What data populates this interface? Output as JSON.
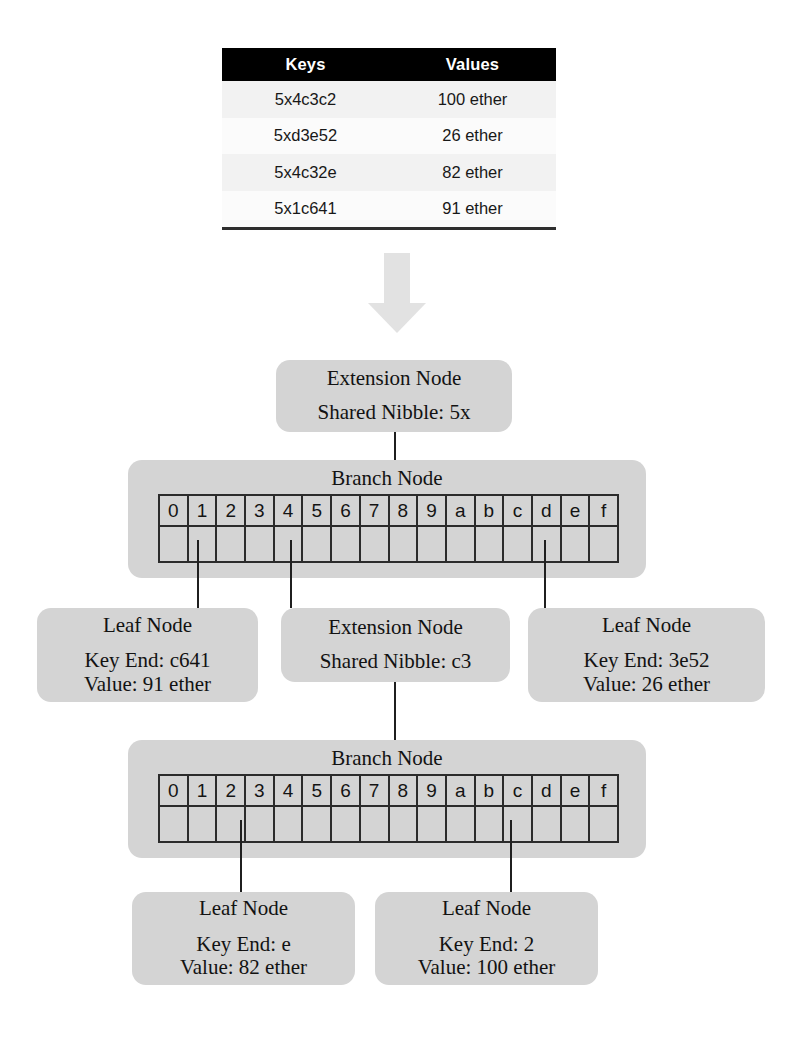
{
  "table": {
    "headers": [
      "Keys",
      "Values"
    ],
    "rows": [
      {
        "key": "5x4c3c2",
        "value": "100 ether"
      },
      {
        "key": "5xd3e52",
        "value": "26 ether"
      },
      {
        "key": "5x4c32e",
        "value": "82 ether"
      },
      {
        "key": "5x1c641",
        "value": "91 ether"
      }
    ]
  },
  "arrow": {
    "name": "down-arrow-icon",
    "color": "#e2e2e2"
  },
  "nibbles": [
    "0",
    "1",
    "2",
    "3",
    "4",
    "5",
    "6",
    "7",
    "8",
    "9",
    "a",
    "b",
    "c",
    "d",
    "e",
    "f"
  ],
  "nodes": {
    "root_extension": {
      "title": "Extension Node",
      "detail": "Shared Nibble: 5x"
    },
    "branch_top": {
      "title": "Branch Node"
    },
    "leaf_left": {
      "title": "Leaf Node",
      "key_end": "Key End: c641",
      "value": "Value: 91 ether"
    },
    "extension_mid": {
      "title": "Extension Node",
      "detail": "Shared Nibble: c3"
    },
    "leaf_right": {
      "title": "Leaf Node",
      "key_end": "Key End: 3e52",
      "value": "Value: 26 ether"
    },
    "branch_bottom": {
      "title": "Branch Node"
    },
    "leaf_bottom_left": {
      "title": "Leaf Node",
      "key_end": "Key End: e",
      "value": "Value: 82 ether"
    },
    "leaf_bottom_right": {
      "title": "Leaf Node",
      "key_end": "Key End: 2",
      "value": "Value: 100 ether"
    }
  },
  "colors": {
    "node_fill": "#d4d4d4",
    "header_fill": "#000000",
    "row_odd": "#f2f2f2",
    "row_even": "#fbfbfb",
    "grid_line": "#2b2b2b",
    "connector": "#1f1f1f",
    "arrow": "#e2e2e2"
  }
}
